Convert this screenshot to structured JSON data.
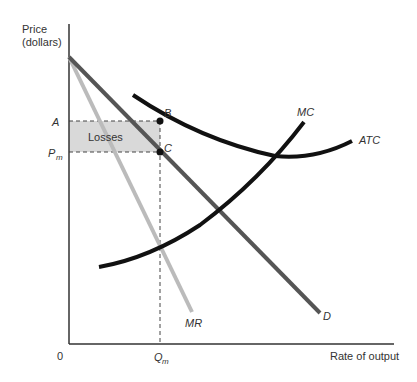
{
  "diagram": {
    "y_axis_label_line1": "Price",
    "y_axis_label_line2": "(dollars)",
    "x_axis_label": "Rate of output",
    "origin_label": "0",
    "price_labels": {
      "a": "A",
      "pm_main": "P",
      "pm_sub": "m"
    },
    "quantity_label": {
      "main": "Q",
      "sub": "m"
    },
    "region_label": "Losses",
    "point_labels": {
      "b": "B",
      "c": "C"
    },
    "curve_labels": {
      "mc": "MC",
      "atc": "ATC",
      "mr": "MR",
      "d": "D"
    },
    "colors": {
      "axis": "#333333",
      "demand": "#555555",
      "mr": "#bbbbbb",
      "cost_curves": "#111111",
      "losses_fill": "#d9d9d9",
      "dashed": "#444444"
    }
  }
}
